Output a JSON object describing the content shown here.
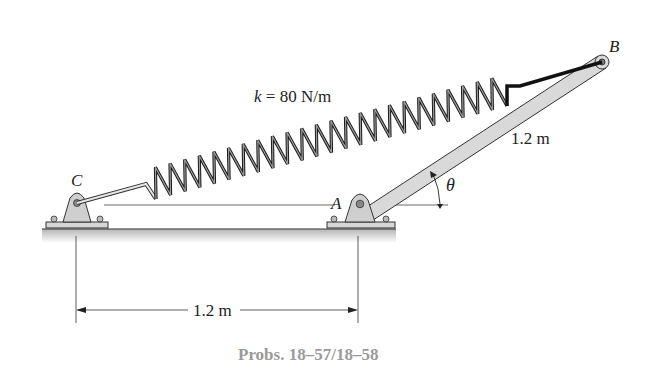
{
  "figure": {
    "spring_label_var": "k",
    "spring_label_value": "= 80 N/m",
    "point_A": "A",
    "point_B": "B",
    "point_C": "C",
    "angle_label": "θ",
    "rod_length_label": "1.2 m",
    "base_distance_label": "1.2 m",
    "caption": "Probs. 18–57/18–58"
  },
  "colors": {
    "rod_fill": "#d9d9d9",
    "support_fill": "#cfcfcf",
    "ground_fill": "#c8c8c8",
    "caption": "#9a9a9a",
    "line": "#222222"
  }
}
